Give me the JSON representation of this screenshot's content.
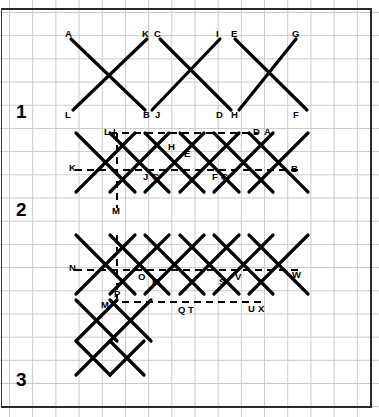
{
  "figure": {
    "background": "#ffffff",
    "grid_color": "#c9c9c9",
    "grid_spacing_px": 23.2,
    "stroke_color": "#000000",
    "frame_color": "#2a2a2a",
    "width": 379,
    "height": 417
  },
  "row_labels": [
    {
      "text": "1",
      "x": 16,
      "y": 102
    },
    {
      "text": "2",
      "x": 16,
      "y": 200
    },
    {
      "text": "3",
      "x": 16,
      "y": 370
    }
  ],
  "rows": [
    {
      "id": "row-1",
      "number": "1",
      "description": "Four long diagonals forming three open X crossings, solid strokes only, no dashed construction lines.",
      "solid_segments": [
        {
          "name": "A-B",
          "x1": 71,
          "y1": 39,
          "x2": 145,
          "y2": 110
        },
        {
          "name": "K-L",
          "x1": 147,
          "y1": 39,
          "x2": 73,
          "y2": 110
        },
        {
          "name": "C-D",
          "x1": 160,
          "y1": 39,
          "x2": 231,
          "y2": 110
        },
        {
          "name": "I-J",
          "x1": 220,
          "y1": 39,
          "x2": 152,
          "y2": 110
        },
        {
          "name": "E-F",
          "x1": 235,
          "y1": 39,
          "x2": 307,
          "y2": 110
        },
        {
          "name": "G-H",
          "x1": 296,
          "y1": 39,
          "x2": 239,
          "y2": 110
        }
      ],
      "dashed_segments": [],
      "point_labels": [
        {
          "text": "A",
          "x": 65,
          "y": 29
        },
        {
          "text": "K",
          "x": 142,
          "y": 29
        },
        {
          "text": "C",
          "x": 154,
          "y": 29
        },
        {
          "text": "I",
          "x": 216,
          "y": 29
        },
        {
          "text": "E",
          "x": 231,
          "y": 29
        },
        {
          "text": "G",
          "x": 292,
          "y": 29
        },
        {
          "text": "L",
          "x": 65,
          "y": 110
        },
        {
          "text": "B",
          "x": 143,
          "y": 110
        },
        {
          "text": "J",
          "x": 155,
          "y": 110
        },
        {
          "text": "D",
          "x": 216,
          "y": 110
        },
        {
          "text": "H",
          "x": 231,
          "y": 110
        },
        {
          "text": "F",
          "x": 293,
          "y": 110
        }
      ]
    },
    {
      "id": "row-2",
      "number": "2",
      "description": "Denser lattice of crossing diagonals with dashed horizontal construction lines at the top and middle, plus one dashed vertical line down to point M.",
      "solid_segments": [
        {
          "name": "d1",
          "x1": 76,
          "y1": 133,
          "x2": 135,
          "y2": 192
        },
        {
          "name": "d2",
          "x1": 110,
          "y1": 133,
          "x2": 169,
          "y2": 192
        },
        {
          "name": "d3",
          "x1": 145,
          "y1": 133,
          "x2": 204,
          "y2": 192
        },
        {
          "name": "d4",
          "x1": 180,
          "y1": 133,
          "x2": 239,
          "y2": 192
        },
        {
          "name": "d5",
          "x1": 214,
          "y1": 133,
          "x2": 273,
          "y2": 192
        },
        {
          "name": "d6",
          "x1": 249,
          "y1": 133,
          "x2": 308,
          "y2": 192
        },
        {
          "name": "u1",
          "x1": 135,
          "y1": 133,
          "x2": 76,
          "y2": 192
        },
        {
          "name": "u2",
          "x1": 169,
          "y1": 133,
          "x2": 110,
          "y2": 192
        },
        {
          "name": "u3",
          "x1": 204,
          "y1": 133,
          "x2": 145,
          "y2": 192
        },
        {
          "name": "u4",
          "x1": 239,
          "y1": 133,
          "x2": 180,
          "y2": 192
        },
        {
          "name": "u5",
          "x1": 273,
          "y1": 133,
          "x2": 214,
          "y2": 192
        },
        {
          "name": "u6",
          "x1": 308,
          "y1": 133,
          "x2": 249,
          "y2": 192
        }
      ],
      "dashed_segments": [
        {
          "name": "top-horizontal-L-to-D",
          "x1": 110,
          "y1": 133,
          "x2": 258,
          "y2": 133
        },
        {
          "name": "mid-horizontal-K-to-B",
          "x1": 75,
          "y1": 170,
          "x2": 298,
          "y2": 170
        },
        {
          "name": "vertical-I-to-M",
          "x1": 117,
          "y1": 133,
          "x2": 117,
          "y2": 208
        }
      ],
      "point_labels": [
        {
          "text": "L",
          "x": 104,
          "y": 127
        },
        {
          "text": "I",
          "x": 113,
          "y": 127
        },
        {
          "text": "H",
          "x": 168,
          "y": 142
        },
        {
          "text": "E",
          "x": 184,
          "y": 149
        },
        {
          "text": "D",
          "x": 253,
          "y": 127
        },
        {
          "text": "A",
          "x": 264,
          "y": 127
        },
        {
          "text": "K",
          "x": 69,
          "y": 163
        },
        {
          "text": "B",
          "x": 291,
          "y": 164
        },
        {
          "text": "J",
          "x": 143,
          "y": 172
        },
        {
          "text": "G",
          "x": 152,
          "y": 172
        },
        {
          "text": "F",
          "x": 212,
          "y": 172
        },
        {
          "text": "C",
          "x": 221,
          "y": 172
        },
        {
          "text": "M",
          "x": 112,
          "y": 206
        }
      ]
    },
    {
      "id": "row-3",
      "number": "3",
      "description": "Full woven lattice of crossing diagonals with two dashed horizontal lines, a dashed vertical segment through P to M, and a small extra block of crossings below the left end.",
      "solid_segments": [
        {
          "name": "d1",
          "x1": 76,
          "y1": 235,
          "x2": 135,
          "y2": 294
        },
        {
          "name": "d2",
          "x1": 110,
          "y1": 235,
          "x2": 169,
          "y2": 294
        },
        {
          "name": "d3",
          "x1": 145,
          "y1": 235,
          "x2": 204,
          "y2": 294
        },
        {
          "name": "d4",
          "x1": 180,
          "y1": 235,
          "x2": 239,
          "y2": 294
        },
        {
          "name": "d5",
          "x1": 214,
          "y1": 235,
          "x2": 273,
          "y2": 294
        },
        {
          "name": "d6",
          "x1": 249,
          "y1": 235,
          "x2": 308,
          "y2": 294
        },
        {
          "name": "u1",
          "x1": 135,
          "y1": 235,
          "x2": 76,
          "y2": 294
        },
        {
          "name": "u2",
          "x1": 169,
          "y1": 235,
          "x2": 110,
          "y2": 294
        },
        {
          "name": "u3",
          "x1": 204,
          "y1": 235,
          "x2": 145,
          "y2": 294
        },
        {
          "name": "u4",
          "x1": 239,
          "y1": 235,
          "x2": 180,
          "y2": 294
        },
        {
          "name": "u5",
          "x1": 273,
          "y1": 235,
          "x2": 214,
          "y2": 294
        },
        {
          "name": "u6",
          "x1": 308,
          "y1": 235,
          "x2": 249,
          "y2": 294
        },
        {
          "name": "lower-d1",
          "x1": 76,
          "y1": 300,
          "x2": 117,
          "y2": 341
        },
        {
          "name": "lower-d2",
          "x1": 110,
          "y1": 300,
          "x2": 151,
          "y2": 341
        },
        {
          "name": "lower-u1",
          "x1": 117,
          "y1": 300,
          "x2": 76,
          "y2": 341
        },
        {
          "name": "lower-u2",
          "x1": 151,
          "y1": 300,
          "x2": 110,
          "y2": 341
        },
        {
          "name": "lower-d3",
          "x1": 76,
          "y1": 341,
          "x2": 110,
          "y2": 375
        },
        {
          "name": "lower-d4",
          "x1": 110,
          "y1": 341,
          "x2": 144,
          "y2": 375
        },
        {
          "name": "lower-u3",
          "x1": 110,
          "y1": 341,
          "x2": 76,
          "y2": 375
        },
        {
          "name": "lower-u4",
          "x1": 144,
          "y1": 341,
          "x2": 110,
          "y2": 375
        }
      ],
      "dashed_segments": [
        {
          "name": "upper-horizontal-N-to-W",
          "x1": 75,
          "y1": 270,
          "x2": 298,
          "y2": 270
        },
        {
          "name": "lower-horizontal-M-to-X",
          "x1": 110,
          "y1": 302,
          "x2": 263,
          "y2": 302
        },
        {
          "name": "vertical-through-P",
          "x1": 117,
          "y1": 235,
          "x2": 117,
          "y2": 302
        }
      ],
      "point_labels": [
        {
          "text": "N",
          "x": 69,
          "y": 263
        },
        {
          "text": "O",
          "x": 138,
          "y": 272
        },
        {
          "text": "R",
          "x": 152,
          "y": 277
        },
        {
          "text": "S",
          "x": 219,
          "y": 277
        },
        {
          "text": "V",
          "x": 235,
          "y": 272
        },
        {
          "text": "W",
          "x": 292,
          "y": 270
        },
        {
          "text": "P",
          "x": 114,
          "y": 289
        },
        {
          "text": "M",
          "x": 101,
          "y": 300
        },
        {
          "text": "Q",
          "x": 178,
          "y": 305
        },
        {
          "text": "T",
          "x": 188,
          "y": 305
        },
        {
          "text": "U",
          "x": 248,
          "y": 304
        },
        {
          "text": "X",
          "x": 258,
          "y": 304
        }
      ]
    }
  ]
}
